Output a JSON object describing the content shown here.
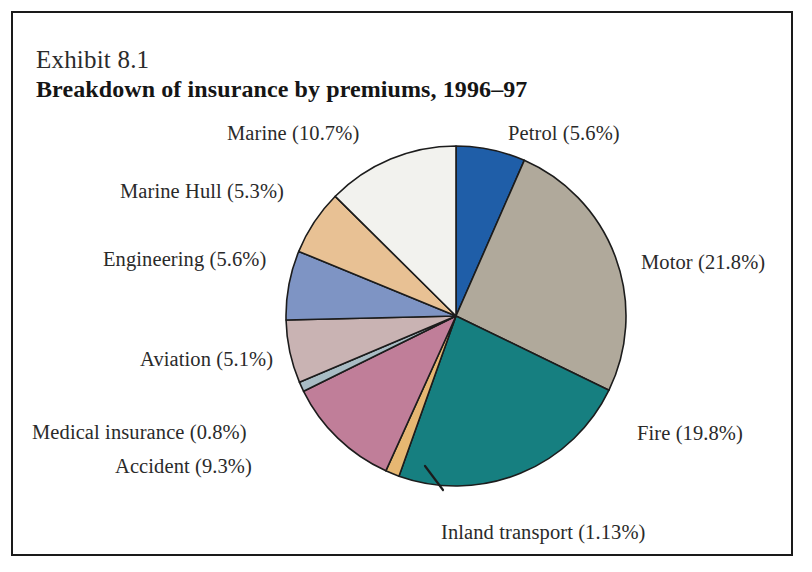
{
  "exhibit": {
    "number": "Exhibit 8.1",
    "title": "Breakdown of insurance by premiums, 1996–97"
  },
  "chart_data": {
    "type": "pie",
    "title": "Breakdown of insurance by premiums, 1996–97",
    "xlabel": "",
    "ylabel": "",
    "value_unit": "percent",
    "legend_position": "outside-labels",
    "grid": false,
    "start_angle_deg": 0,
    "direction": "clockwise",
    "categories": [
      "Petrol",
      "Motor",
      "Fire",
      "Inland transport",
      "Accident",
      "Medical insurance",
      "Aviation",
      "Engineering",
      "Marine Hull",
      "Marine"
    ],
    "values": [
      5.6,
      21.8,
      19.8,
      1.13,
      9.3,
      0.8,
      5.1,
      5.6,
      5.3,
      10.7
    ],
    "colors": [
      "#1f5ea8",
      "#b0a99b",
      "#167f80",
      "#e6b772",
      "#c07e99",
      "#a8bcc4",
      "#c9b3b3",
      "#7e94c4",
      "#e8c194",
      "#f2f2ee"
    ],
    "slices": [
      {
        "label": "Petrol",
        "value": 5.6,
        "label_text": "Petrol (5.6%)",
        "color": "#1f5ea8"
      },
      {
        "label": "Motor",
        "value": 21.8,
        "label_text": "Motor (21.8%)",
        "color": "#b0a99b"
      },
      {
        "label": "Fire",
        "value": 19.8,
        "label_text": "Fire (19.8%)",
        "color": "#167f80"
      },
      {
        "label": "Inland transport",
        "value": 1.13,
        "label_text": "Inland transport (1.13%)",
        "color": "#e6b772"
      },
      {
        "label": "Accident",
        "value": 9.3,
        "label_text": "Accident (9.3%)",
        "color": "#c07e99"
      },
      {
        "label": "Medical insurance",
        "value": 0.8,
        "label_text": "Medical insurance (0.8%)",
        "color": "#a8bcc4"
      },
      {
        "label": "Aviation",
        "value": 5.1,
        "label_text": "Aviation (5.1%)",
        "color": "#c9b3b3"
      },
      {
        "label": "Engineering",
        "value": 5.6,
        "label_text": "Engineering (5.6%)",
        "color": "#7e94c4"
      },
      {
        "label": "Marine Hull",
        "value": 5.3,
        "label_text": "Marine Hull (5.3%)",
        "color": "#e8c194"
      },
      {
        "label": "Marine",
        "value": 10.7,
        "label_text": "Marine (10.7%)",
        "color": "#f2f2ee"
      }
    ]
  },
  "style": {
    "frame_color": "#1a1a1a",
    "slice_outline": "#1c1c1c",
    "background": "#ffffff",
    "text_color": "#2a2a2a"
  }
}
